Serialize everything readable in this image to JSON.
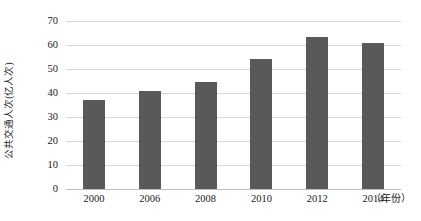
{
  "chart_data": {
    "type": "bar",
    "title": "",
    "subtitle": "",
    "xlabel": "（年份）",
    "ylabel": "公共交通人次(亿人次)",
    "categories": [
      "2000",
      "2006",
      "2008",
      "2010",
      "2012",
      "2014"
    ],
    "values": [
      37,
      41,
      44.5,
      54,
      63.5,
      61
    ],
    "series": [
      {
        "name": "公共交通人次",
        "values": [
          37,
          41,
          44.5,
          54,
          63.5,
          61
        ]
      }
    ],
    "ylim": [
      0,
      70
    ],
    "yticks": [
      0,
      10,
      20,
      30,
      40,
      50,
      60,
      70
    ],
    "ytick_labels": [
      "0",
      "10",
      "20",
      "30",
      "40",
      "50",
      "60",
      "70"
    ],
    "grid": true,
    "grid_axis": "y",
    "legend": false,
    "legend_position": "none",
    "bar_color": "#595959",
    "grid_color": "#d6d6d6",
    "axis_color": "#bdbdbd",
    "background_color": "#ffffff",
    "data_labels": false
  }
}
